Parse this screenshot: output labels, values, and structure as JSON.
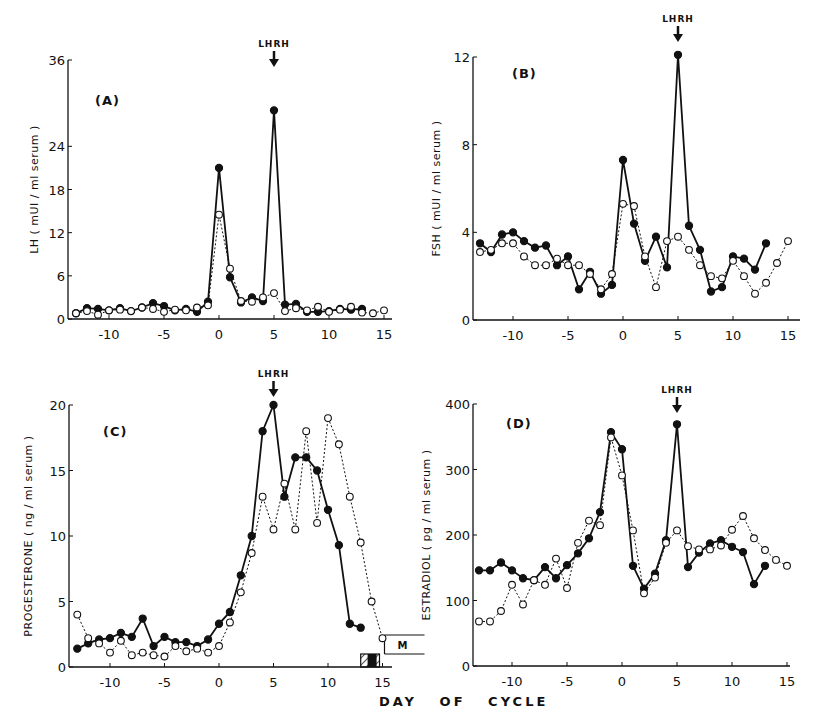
{
  "figure": {
    "xlabel": "DAY   OF   CYCLE",
    "marker_label": "LHRH",
    "menses_label": "M"
  },
  "chart_data": [
    {
      "type": "line",
      "panel": "(A)",
      "title": "(A)",
      "xlabel": "DAY OF CYCLE",
      "ylabel": "LH ( mUI / ml serum )",
      "xlim": [
        -13,
        15
      ],
      "ylim": [
        0,
        36
      ],
      "xticks": [
        -10,
        -5,
        0,
        5,
        10,
        15
      ],
      "yticks": [
        0,
        6,
        12,
        18,
        24,
        36
      ],
      "ytick_labels": [
        "0",
        "6",
        "12",
        "18",
        "24",
        "36"
      ],
      "annotation": {
        "text": "LHRH",
        "x": 5
      },
      "series": [
        {
          "name": "LHRH-treated cycle (filled circles, solid line)",
          "style": "solid-filled",
          "x": [
            -13,
            -12,
            -11,
            -10,
            -9,
            -8,
            -7,
            -6,
            -5,
            -4,
            -3,
            -2,
            -1,
            0,
            1,
            2,
            3,
            4,
            5,
            6,
            7,
            8,
            9,
            10,
            11,
            12,
            13
          ],
          "values": [
            0.8,
            1.5,
            1.4,
            1.2,
            1.5,
            1.1,
            1.6,
            2.2,
            1.8,
            1.2,
            1.4,
            1.0,
            2.4,
            21,
            5.8,
            2.3,
            3.0,
            2.5,
            29,
            2.0,
            2.1,
            1.0,
            1.0,
            1.1,
            1.4,
            1.3,
            1.4
          ]
        },
        {
          "name": "Control cycle (open circles, dotted line)",
          "style": "dotted-open",
          "x": [
            -13,
            -12,
            -11,
            -10,
            -9,
            -8,
            -7,
            -6,
            -5,
            -4,
            -3,
            -2,
            -1,
            0,
            1,
            2,
            3,
            4,
            5,
            6,
            7,
            8,
            9,
            10,
            11,
            12,
            13,
            14,
            15
          ],
          "values": [
            0.8,
            1.1,
            0.6,
            1.2,
            1.3,
            1.1,
            1.6,
            1.4,
            1.0,
            1.3,
            1.2,
            1.6,
            1.9,
            14.5,
            7.0,
            2.5,
            2.4,
            3.0,
            3.6,
            1.1,
            1.5,
            1.2,
            1.7,
            1.0,
            1.3,
            1.7,
            0.9,
            0.8,
            1.2
          ]
        }
      ]
    },
    {
      "type": "line",
      "panel": "(B)",
      "title": "(B)",
      "xlabel": "DAY OF CYCLE",
      "ylabel": "FSH ( mUI / ml serum )",
      "xlim": [
        -13,
        15
      ],
      "ylim": [
        0,
        12
      ],
      "xticks": [
        -10,
        -5,
        0,
        5,
        10,
        15
      ],
      "yticks": [
        0,
        4,
        8,
        12
      ],
      "ytick_labels": [
        "0",
        "4",
        "8",
        "12"
      ],
      "annotation": {
        "text": "LHRH",
        "x": 5
      },
      "series": [
        {
          "name": "LHRH-treated cycle (filled circles, solid line)",
          "style": "solid-filled",
          "x": [
            -13,
            -12,
            -11,
            -10,
            -9,
            -8,
            -7,
            -6,
            -5,
            -4,
            -3,
            -2,
            -1,
            0,
            1,
            2,
            3,
            4,
            5,
            6,
            7,
            8,
            9,
            10,
            11,
            12,
            13
          ],
          "values": [
            3.5,
            3.1,
            3.9,
            4.0,
            3.6,
            3.3,
            3.4,
            2.5,
            2.9,
            1.4,
            2.2,
            1.2,
            1.6,
            7.3,
            4.4,
            2.7,
            3.8,
            2.4,
            12.1,
            4.3,
            3.2,
            1.3,
            1.5,
            2.9,
            2.8,
            2.3,
            3.5
          ]
        },
        {
          "name": "Control cycle (open circles, dotted line)",
          "style": "dotted-open",
          "x": [
            -13,
            -12,
            -11,
            -10,
            -9,
            -8,
            -7,
            -6,
            -5,
            -4,
            -3,
            -2,
            -1,
            0,
            1,
            2,
            3,
            4,
            5,
            6,
            7,
            8,
            9,
            10,
            11,
            12,
            13,
            14,
            15
          ],
          "values": [
            3.1,
            3.2,
            3.5,
            3.5,
            2.9,
            2.5,
            2.5,
            2.8,
            2.5,
            2.5,
            2.1,
            1.4,
            2.1,
            5.3,
            5.2,
            2.9,
            1.5,
            3.6,
            3.8,
            3.2,
            2.5,
            2.0,
            1.9,
            2.7,
            2.0,
            1.2,
            1.7,
            2.6,
            3.6
          ]
        }
      ]
    },
    {
      "type": "line",
      "panel": "(C)",
      "title": "(C)",
      "xlabel": "DAY OF CYCLE",
      "ylabel": "PROGESTERONE ( ng / ml serum )",
      "xlim": [
        -13,
        15
      ],
      "ylim": [
        0,
        20
      ],
      "xticks": [
        -10,
        -5,
        0,
        5,
        10,
        15
      ],
      "yticks": [
        0,
        5,
        10,
        15,
        20
      ],
      "ytick_labels": [
        "0",
        "5",
        "10",
        "15",
        "20"
      ],
      "annotation": {
        "text": "LHRH",
        "x": 5
      },
      "menses": {
        "label": "M",
        "start_day": 13,
        "end_day": 15
      },
      "series": [
        {
          "name": "LHRH-treated cycle (filled circles, solid line)",
          "style": "solid-filled",
          "x": [
            -13,
            -12,
            -11,
            -10,
            -9,
            -8,
            -7,
            -6,
            -5,
            -4,
            -3,
            -2,
            -1,
            0,
            1,
            2,
            3,
            4,
            5,
            6,
            7,
            8,
            9,
            10,
            11,
            12,
            13
          ],
          "values": [
            1.4,
            1.8,
            2.1,
            2.2,
            2.6,
            2.3,
            3.7,
            1.6,
            2.3,
            1.9,
            1.9,
            1.6,
            2.1,
            3.3,
            4.2,
            7.0,
            10.0,
            18.0,
            20.0,
            13.0,
            16.0,
            16.0,
            15.0,
            12.0,
            9.3,
            3.3,
            3.0
          ]
        },
        {
          "name": "Control cycle (open circles, dotted line)",
          "style": "dotted-open",
          "x": [
            -13,
            -12,
            -11,
            -10,
            -9,
            -8,
            -7,
            -6,
            -5,
            -4,
            -3,
            -2,
            -1,
            0,
            1,
            2,
            3,
            4,
            5,
            6,
            7,
            8,
            9,
            10,
            11,
            12,
            13,
            14,
            15
          ],
          "values": [
            4.0,
            2.2,
            1.8,
            1.1,
            2.0,
            0.9,
            1.1,
            0.9,
            0.8,
            1.6,
            1.2,
            1.4,
            1.1,
            1.6,
            3.4,
            5.7,
            8.7,
            13.0,
            10.5,
            14.0,
            10.5,
            18.0,
            11.0,
            19.0,
            17.0,
            13.0,
            9.5,
            5.0,
            2.2
          ]
        }
      ]
    },
    {
      "type": "line",
      "panel": "(D)",
      "title": "(D)",
      "xlabel": "DAY OF CYCLE",
      "ylabel": "ESTRADIOL ( pg / ml serum )",
      "xlim": [
        -13,
        15
      ],
      "ylim": [
        0,
        400
      ],
      "xticks": [
        -10,
        -5,
        0,
        5,
        10,
        15
      ],
      "yticks": [
        0,
        100,
        200,
        300,
        400
      ],
      "ytick_labels": [
        "0",
        "100",
        "200",
        "300",
        "400"
      ],
      "annotation": {
        "text": "LHRH",
        "x": 5
      },
      "series": [
        {
          "name": "LHRH-treated cycle (filled circles, solid line)",
          "style": "solid-filled",
          "x": [
            -13,
            -12,
            -11,
            -10,
            -9,
            -8,
            -7,
            -6,
            -5,
            -4,
            -3,
            -2,
            -1,
            0,
            1,
            2,
            3,
            4,
            5,
            6,
            7,
            8,
            9,
            10,
            11,
            12,
            13
          ],
          "values": [
            146,
            146,
            158,
            146,
            134,
            131,
            151,
            134,
            154,
            172,
            195,
            235,
            357,
            331,
            153,
            118,
            141,
            192,
            369,
            151,
            173,
            187,
            192,
            182,
            174,
            125,
            153
          ]
        },
        {
          "name": "Control cycle (open circles, dotted line)",
          "style": "dotted-open",
          "x": [
            -13,
            -12,
            -11,
            -10,
            -9,
            -8,
            -7,
            -6,
            -5,
            -4,
            -3,
            -2,
            -1,
            0,
            1,
            2,
            3,
            4,
            5,
            6,
            7,
            8,
            9,
            10,
            11,
            12,
            13,
            14,
            15
          ],
          "values": [
            68,
            68,
            84,
            124,
            94,
            131,
            124,
            164,
            119,
            188,
            222,
            215,
            349,
            291,
            207,
            111,
            135,
            188,
            207,
            183,
            178,
            178,
            184,
            208,
            229,
            195,
            177,
            162,
            153
          ]
        }
      ]
    }
  ]
}
